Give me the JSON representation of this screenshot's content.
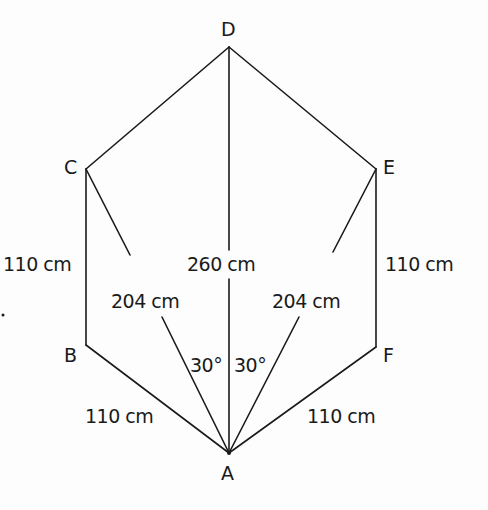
{
  "diagram": {
    "type": "geometry-figure",
    "vertices": {
      "A": {
        "label": "A",
        "x": 229,
        "y": 453
      },
      "B": {
        "label": "B",
        "x": 86,
        "y": 345
      },
      "C": {
        "label": "C",
        "x": 86,
        "y": 169
      },
      "D": {
        "label": "D",
        "x": 229,
        "y": 47
      },
      "E": {
        "label": "E",
        "x": 376,
        "y": 169
      },
      "F": {
        "label": "F",
        "x": 376,
        "y": 347
      }
    },
    "edges": [
      {
        "from": "D",
        "to": "C"
      },
      {
        "from": "D",
        "to": "E"
      },
      {
        "from": "C",
        "to": "B"
      },
      {
        "from": "E",
        "to": "F"
      },
      {
        "from": "B",
        "to": "A"
      },
      {
        "from": "F",
        "to": "A"
      },
      {
        "from": "C",
        "to": "A"
      },
      {
        "from": "E",
        "to": "A"
      },
      {
        "from": "D",
        "to": "A"
      }
    ],
    "measurements": {
      "CB": "110 cm",
      "EF": "110 cm",
      "BA": "110 cm",
      "FA": "110 cm",
      "CA": "204 cm",
      "EA": "204 cm",
      "DA": "260 cm"
    },
    "angles": {
      "CAD": "30°",
      "DAE": "30°"
    },
    "line_color": "#1a1a1a"
  }
}
